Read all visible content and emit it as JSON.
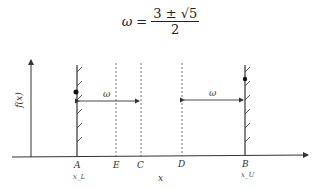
{
  "formula": {
    "lhs": "ω",
    "eq": "=",
    "numerator": "3 ± √5",
    "denominator": "2"
  },
  "diagram": {
    "y_axis_label": "f(x)",
    "x_axis_label": "x",
    "points": [
      {
        "name": "A",
        "sub": "x_L"
      },
      {
        "name": "E"
      },
      {
        "name": "C"
      },
      {
        "name": "D"
      },
      {
        "name": "B",
        "sub": "x_U"
      }
    ],
    "left_arrow_label": "ω",
    "right_arrow_label": "ω"
  }
}
